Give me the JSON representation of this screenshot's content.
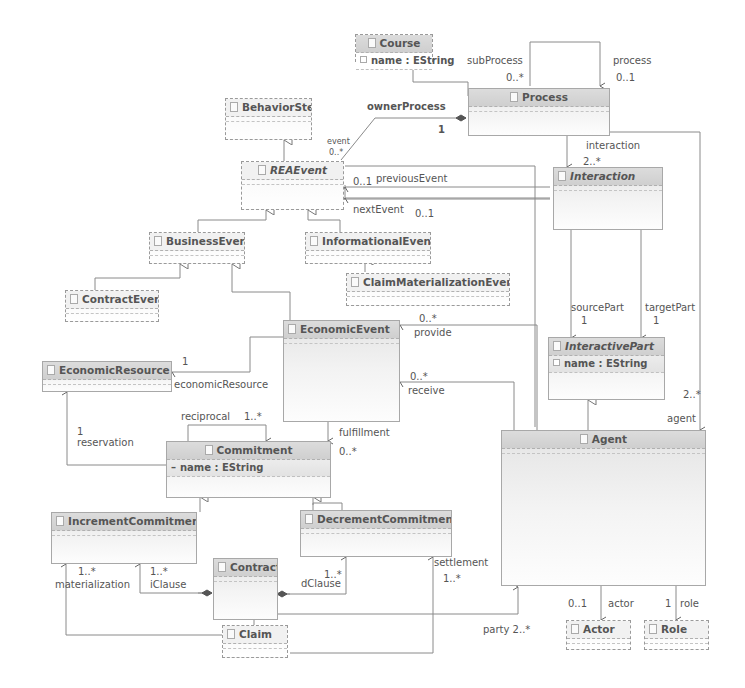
{
  "diagram": {
    "type": "UML class diagram (Ecore)",
    "classes": [
      {
        "id": "course",
        "name": "Course",
        "abstract": false,
        "attributes": [
          "name : EString"
        ]
      },
      {
        "id": "process",
        "name": "Process",
        "abstract": false,
        "attributes": []
      },
      {
        "id": "behaviorstep",
        "name": "BehaviorStep",
        "abstract": false,
        "attributes": []
      },
      {
        "id": "reaevent",
        "name": "REAEvent",
        "abstract": true,
        "attributes": []
      },
      {
        "id": "interaction",
        "name": "Interaction",
        "abstract": true,
        "attributes": []
      },
      {
        "id": "businessevent",
        "name": "BusinessEvent",
        "abstract": false,
        "attributes": []
      },
      {
        "id": "informationalevent",
        "name": "InformationalEvent",
        "abstract": false,
        "attributes": []
      },
      {
        "id": "contractevent",
        "name": "ContractEvent",
        "abstract": false,
        "attributes": []
      },
      {
        "id": "claimmaterializationevent",
        "name": "ClaimMaterializationEvent",
        "abstract": false,
        "attributes": []
      },
      {
        "id": "economicevent",
        "name": "EconomicEvent",
        "abstract": false,
        "attributes": []
      },
      {
        "id": "interactivepart",
        "name": "InteractivePart",
        "abstract": true,
        "attributes": [
          "name : EString"
        ]
      },
      {
        "id": "economicresource",
        "name": "EconomicResource",
        "abstract": false,
        "attributes": []
      },
      {
        "id": "commitment",
        "name": "Commitment",
        "abstract": false,
        "attributes": [
          "name : EString"
        ]
      },
      {
        "id": "agent",
        "name": "Agent",
        "abstract": false,
        "attributes": []
      },
      {
        "id": "incrementcommitment",
        "name": "IncrementCommitment",
        "abstract": false,
        "attributes": []
      },
      {
        "id": "decrementcommitment",
        "name": "DecrementCommitment",
        "abstract": false,
        "attributes": []
      },
      {
        "id": "contract",
        "name": "Contract",
        "abstract": false,
        "attributes": []
      },
      {
        "id": "claim",
        "name": "Claim",
        "abstract": false,
        "attributes": []
      },
      {
        "id": "actor",
        "name": "Actor",
        "abstract": false,
        "attributes": []
      },
      {
        "id": "role",
        "name": "Role",
        "abstract": false,
        "attributes": []
      }
    ],
    "labels": {
      "subProcess": "subProcess",
      "subProcess_mult": "0..*",
      "process": "process",
      "process_mult": "0..1",
      "ownerProcess": "ownerProcess",
      "ownerProcess_mult": "1",
      "event": "event",
      "event_mult": "0..*",
      "interaction": "interaction",
      "interaction_mult": "2..*",
      "previousEvent_mult": "0..1",
      "previousEvent": "previousEvent",
      "nextEvent": "nextEvent",
      "nextEvent_mult": "0..1",
      "sourcePart": "sourcePart",
      "sourcePart_mult": "1",
      "targetPart": "targetPart",
      "targetPart_mult": "1",
      "provide_mult": "0..*",
      "provide": "provide",
      "receive_mult": "0..*",
      "receive": "receive",
      "economicResource_mult": "1",
      "economicResource": "economicResource",
      "reciprocal": "reciprocal",
      "reciprocal_mult": "1..*",
      "reservation_mult": "1",
      "reservation": "reservation",
      "fulfillment": "fulfillment",
      "fulfillment_mult": "0..*",
      "agent_mult": "2..*",
      "agent": "agent",
      "materialization_mult": "1..*",
      "materialization": "materialization",
      "iClause_mult": "1..*",
      "iClause": "iClause",
      "dClause_mult": "1..*",
      "dClause": "dClause",
      "settlement": "settlement",
      "settlement_mult": "1..*",
      "party": "party 2..*",
      "actor_mult": "0..1",
      "actor": "actor",
      "role_mult": "1",
      "role": "role"
    },
    "relations": [
      {
        "kind": "generalization",
        "from": "Process",
        "to": "Course"
      },
      {
        "kind": "generalization",
        "from": "REAEvent",
        "to": "BehaviorStep"
      },
      {
        "kind": "generalization",
        "from": "BusinessEvent",
        "to": "REAEvent"
      },
      {
        "kind": "generalization",
        "from": "InformationalEvent",
        "to": "REAEvent"
      },
      {
        "kind": "generalization",
        "from": "ContractEvent",
        "to": "BusinessEvent"
      },
      {
        "kind": "generalization",
        "from": "EconomicEvent",
        "to": "BusinessEvent"
      },
      {
        "kind": "generalization",
        "from": "ClaimMaterializationEvent",
        "to": "InformationalEvent"
      },
      {
        "kind": "generalization",
        "from": "Agent",
        "to": "InteractivePart"
      },
      {
        "kind": "generalization",
        "from": "IncrementCommitment",
        "to": "Commitment"
      },
      {
        "kind": "generalization",
        "from": "DecrementCommitment",
        "to": "Commitment"
      },
      {
        "kind": "association",
        "from": "Process",
        "to": "Process",
        "role": "subProcess",
        "mult": "0..*"
      },
      {
        "kind": "association",
        "from": "Process",
        "to": "Process",
        "role": "process",
        "mult": "0..1"
      },
      {
        "kind": "composition",
        "from": "Process",
        "to": "REAEvent",
        "role": "event",
        "mult": "0..*",
        "opposite": "ownerProcess",
        "opposite_mult": "1"
      },
      {
        "kind": "composition",
        "from": "Process",
        "to": "Interaction",
        "role": "interaction",
        "mult": "2..*"
      },
      {
        "kind": "association",
        "from": "Interaction",
        "to": "REAEvent",
        "role": "previousEvent",
        "mult": "0..1"
      },
      {
        "kind": "association",
        "from": "Interaction",
        "to": "REAEvent",
        "role": "nextEvent",
        "mult": "0..1"
      },
      {
        "kind": "association",
        "from": "Interaction",
        "to": "InteractivePart",
        "role": "sourcePart",
        "mult": "1"
      },
      {
        "kind": "association",
        "from": "Interaction",
        "to": "InteractivePart",
        "role": "targetPart",
        "mult": "1"
      },
      {
        "kind": "association",
        "from": "Process",
        "to": "Agent",
        "role": "agent",
        "mult": "2..*"
      },
      {
        "kind": "association",
        "from": "Agent",
        "to": "EconomicEvent",
        "role": "provide",
        "mult": "0..*"
      },
      {
        "kind": "association",
        "from": "Agent",
        "to": "EconomicEvent",
        "role": "receive",
        "mult": "0..*"
      },
      {
        "kind": "association",
        "from": "EconomicEvent",
        "to": "EconomicResource",
        "role": "economicResource",
        "mult": "1"
      },
      {
        "kind": "association",
        "from": "Commitment",
        "to": "EconomicResource",
        "role": "reservation",
        "mult": "1"
      },
      {
        "kind": "association",
        "from": "Commitment",
        "to": "Commitment",
        "role": "reciprocal",
        "mult": "1..*"
      },
      {
        "kind": "association",
        "from": "EconomicEvent",
        "to": "Commitment",
        "role": "fulfillment",
        "mult": "0..*"
      },
      {
        "kind": "association",
        "from": "Claim",
        "to": "IncrementCommitment",
        "role": "materialization",
        "mult": "1..*"
      },
      {
        "kind": "composition",
        "from": "Contract",
        "to": "IncrementCommitment",
        "role": "iClause",
        "mult": "1..*"
      },
      {
        "kind": "composition",
        "from": "Contract",
        "to": "DecrementCommitment",
        "role": "dClause",
        "mult": "1..*"
      },
      {
        "kind": "association",
        "from": "Claim",
        "to": "DecrementCommitment",
        "role": "settlement",
        "mult": "1..*"
      },
      {
        "kind": "association",
        "from": "Contract",
        "to": "Agent",
        "role": "party",
        "mult": "2..*"
      },
      {
        "kind": "association",
        "from": "Agent",
        "to": "Actor",
        "role": "actor",
        "mult": "0..1"
      },
      {
        "kind": "association",
        "from": "Agent",
        "to": "Role",
        "role": "role",
        "mult": "1"
      }
    ]
  }
}
